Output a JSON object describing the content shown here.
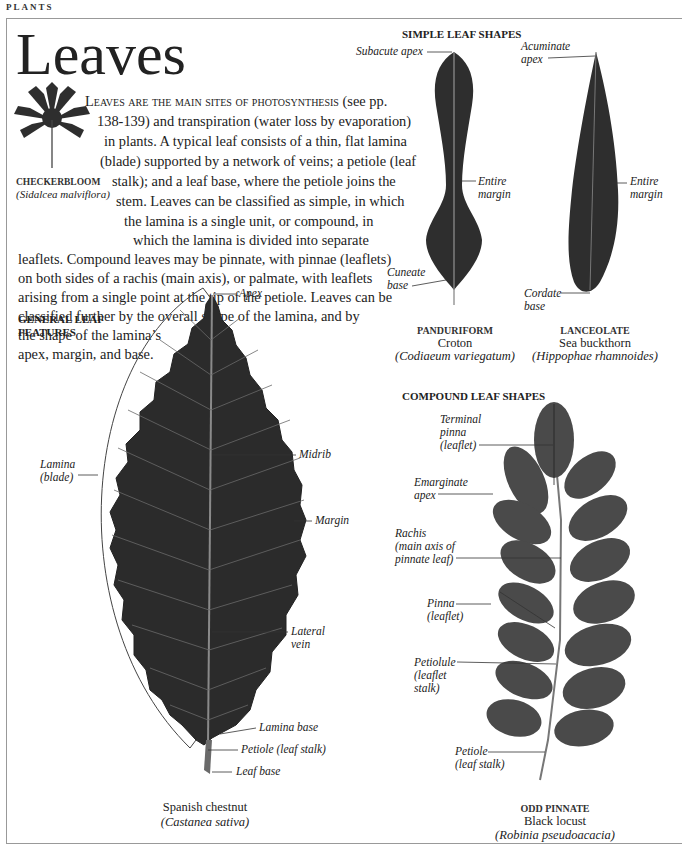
{
  "page": {
    "section_tag": "PLANTS",
    "title": "Leaves"
  },
  "intro": {
    "lines": [
      {
        "smallcaps": "Leaves are the main sites of photosynthesis",
        "rest": " (see pp."
      },
      {
        "text": "138-139) and transpiration (water loss by evaporation)"
      },
      {
        "text": "in plants. A typical leaf consists of a thin, flat lamina"
      },
      {
        "text": "(blade) supported by a network of veins; a petiole (leaf"
      },
      {
        "text": "stalk); and a leaf base, where the petiole joins the"
      },
      {
        "text": "stem. Leaves can be classified as simple, in which"
      },
      {
        "text": "the lamina is a single unit, or compound, in"
      },
      {
        "text": "which the lamina is divided into separate"
      },
      {
        "text": "leaflets. Compound leaves may be pinnate, with pinnae (leaflets)"
      },
      {
        "text": "on both sides of a rachis (main axis), or palmate, with leaflets"
      },
      {
        "text": "arising from a single point at the tip of the petiole. Leaves can be"
      },
      {
        "text": "classified further by the overall shape of the lamina, and by"
      },
      {
        "text": "the shape of the lamina’s"
      },
      {
        "text": "apex, margin, and base."
      }
    ]
  },
  "checkerbloom": {
    "common": "CHECKERBLOOM",
    "scientific": "Sidalcea malviflora"
  },
  "general_leaf": {
    "heading_line1": "GENERAL LEAF",
    "heading_line2": "FEATURES",
    "labels": {
      "apex": "Apex",
      "midrib": "Midrib",
      "margin": "Margin",
      "lamina_1": "Lamina",
      "lamina_2": "(blade)",
      "lateral_1": "Lateral",
      "lateral_2": "vein",
      "lamina_base": "Lamina base",
      "petiole": "Petiole (leaf stalk)",
      "leaf_base": "Leaf base"
    },
    "caption_common": "Spanish chestnut",
    "caption_sci": "Castanea sativa"
  },
  "simple_shapes": {
    "heading": "SIMPLE LEAF SHAPES",
    "panduriform": {
      "labels": {
        "apex": "Subacute apex",
        "margin_1": "Entire",
        "margin_2": "margin",
        "base_1": "Cuneate",
        "base_2": "base"
      },
      "type": "PANDURIFORM",
      "common": "Croton",
      "scientific": "Codiaeum variegatum"
    },
    "lanceolate": {
      "labels": {
        "apex_1": "Acuminate",
        "apex_2": "apex",
        "margin_1": "Entire",
        "margin_2": "margin",
        "base_1": "Cordate",
        "base_2": "base"
      },
      "type": "LANCEOLATE",
      "common": "Sea buckthorn",
      "scientific": "Hippophae rhamnoides"
    }
  },
  "compound_shapes": {
    "heading": "COMPOUND LEAF SHAPES",
    "labels": {
      "terminal_1": "Terminal",
      "terminal_2": "pinna",
      "terminal_3": "(leaflet)",
      "emarginate_1": "Emarginate",
      "emarginate_2": "apex",
      "rachis_1": "Rachis",
      "rachis_2": "(main axis of",
      "rachis_3": "pinnate leaf)",
      "pinna_1": "Pinna",
      "pinna_2": "(leaflet)",
      "petiolule_1": "Petiolule",
      "petiolule_2": "(leaflet",
      "petiolule_3": "stalk)",
      "petiole_1": "Petiole",
      "petiole_2": "(leaf stalk)"
    },
    "type": "ODD PINNATE",
    "common": "Black locust",
    "scientific": "Robinia pseudoacacia"
  },
  "colors": {
    "leaf_dark": "#2b2b2b",
    "leaf_mid": "#3a3a3a",
    "pinna": "#4a4a4a",
    "vein": "#8a8a8a",
    "frame": "#999999",
    "text": "#222222"
  }
}
